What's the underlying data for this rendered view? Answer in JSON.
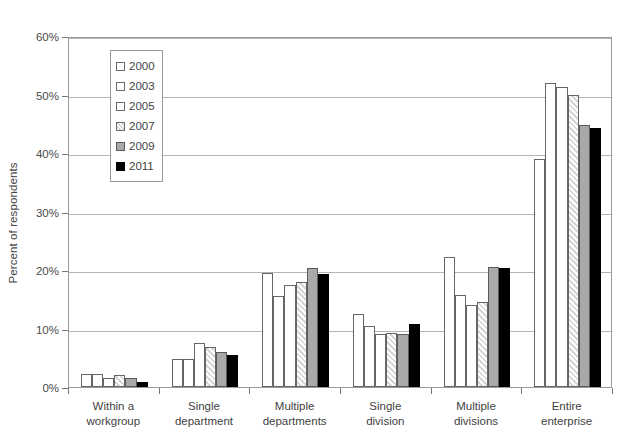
{
  "chart_data": {
    "type": "bar",
    "title": "",
    "subtitle": "",
    "xlabel": "",
    "ylabel": "Percent of respondents",
    "ylim": [
      0,
      60
    ],
    "ytick_values": [
      0,
      10,
      20,
      30,
      40,
      50,
      60
    ],
    "ytick_labels": [
      "0%",
      "10%",
      "20%",
      "30%",
      "40%",
      "50%",
      "60%"
    ],
    "grid": "horizontal",
    "legend_position": "upper-left-inside",
    "value_suffix": "%",
    "categories": [
      "Within a workgroup",
      "Single department",
      "Multiple departments",
      "Single division",
      "Multiple divisions",
      "Entire enterprise"
    ],
    "category_lines": [
      [
        "Within a",
        "workgroup"
      ],
      [
        "Single",
        "department"
      ],
      [
        "Multiple",
        "departments"
      ],
      [
        "Single",
        "division"
      ],
      [
        "Multiple",
        "divisions"
      ],
      [
        "Entire",
        "enterprise"
      ]
    ],
    "series": [
      {
        "name": "2000",
        "swatch": "white",
        "color": "#ffffff",
        "values": [
          2.2,
          4.8,
          19.5,
          12.5,
          22.3,
          39.0
        ]
      },
      {
        "name": "2003",
        "swatch": "white",
        "color": "#ffffff",
        "values": [
          2.2,
          4.8,
          15.5,
          10.5,
          15.8,
          52.0
        ]
      },
      {
        "name": "2005",
        "swatch": "white",
        "color": "#ffffff",
        "values": [
          1.6,
          7.5,
          17.5,
          9.0,
          14.0,
          51.3
        ]
      },
      {
        "name": "2007",
        "swatch": "hatched",
        "color": "#e0e0e0",
        "values": [
          2.0,
          6.8,
          17.9,
          9.3,
          14.6,
          50.0
        ]
      },
      {
        "name": "2009",
        "swatch": "gray",
        "color": "#a9a9a9",
        "values": [
          1.6,
          6.0,
          20.3,
          9.0,
          20.5,
          44.8
        ]
      },
      {
        "name": "2011",
        "swatch": "black",
        "color": "#000000",
        "values": [
          0.8,
          5.5,
          19.3,
          10.8,
          20.3,
          44.3
        ]
      }
    ]
  },
  "legend": {
    "items": [
      {
        "label": "2000"
      },
      {
        "label": "2003"
      },
      {
        "label": "2005"
      },
      {
        "label": "2007"
      },
      {
        "label": "2009"
      },
      {
        "label": "2011"
      }
    ]
  }
}
